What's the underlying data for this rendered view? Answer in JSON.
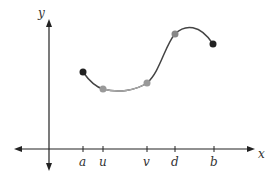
{
  "diagram": {
    "axes": {
      "x_label": "x",
      "y_label": "y"
    },
    "ticks": [
      {
        "label": "a",
        "x": 83
      },
      {
        "label": "u",
        "x": 103
      },
      {
        "label": "v",
        "x": 147
      },
      {
        "label": "d",
        "x": 175
      },
      {
        "label": "b",
        "x": 214
      }
    ],
    "points": [
      {
        "name": "a",
        "style": "endpoint",
        "color": "#222222"
      },
      {
        "name": "u",
        "style": "interior",
        "color": "#999999"
      },
      {
        "name": "v",
        "style": "interior",
        "color": "#999999"
      },
      {
        "name": "d",
        "style": "interior",
        "color": "#888888"
      },
      {
        "name": "b",
        "style": "endpoint",
        "color": "#222222"
      }
    ]
  }
}
